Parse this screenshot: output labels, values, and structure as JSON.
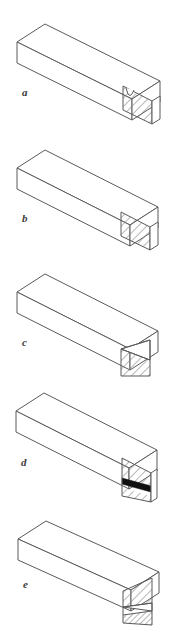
{
  "figure": {
    "background_color": "#ffffff",
    "line_color": "#5a5a5a",
    "hatch_color": "#7a7a7a",
    "solid_fill_color": "#111111",
    "face_fill_color": "#ffffff",
    "label_color": "#3a3a3a",
    "width": 174,
    "height": 629,
    "panels": [
      {
        "id": "a",
        "label": "a",
        "label_x": 22,
        "label_y": 96,
        "top_offset": 0,
        "end_pattern": "hatched-with-round-groove",
        "end_description": "End face fully cross-hatched with a small U-shaped groove notch at the top edge"
      },
      {
        "id": "b",
        "label": "b",
        "label_x": 22,
        "label_y": 96,
        "top_offset": 126,
        "end_pattern": "hatched-plain",
        "end_description": "End face fully cross-hatched, no inclusions"
      },
      {
        "id": "c",
        "label": "c",
        "label_x": 22,
        "label_y": 96,
        "top_offset": 252,
        "end_pattern": "hatched-with-diagonal-band",
        "end_description": "End face with a clear triangular wedge across the upper portion and cross-hatching below the diagonal"
      },
      {
        "id": "d",
        "label": "d",
        "label_x": 22,
        "label_y": 96,
        "top_offset": 378,
        "end_pattern": "hatched-with-solid-black-band",
        "end_description": "End face cross-hatched with a solid black horizontal band across the lower third"
      },
      {
        "id": "e",
        "label": "e",
        "label_x": 22,
        "label_y": 96,
        "top_offset": 503,
        "end_pattern": "hatched-layered-bands",
        "end_description": "End face divided into layered horizontal bands: hatched block, clear triangular wedge, and a dense hatched strip at the bottom"
      }
    ]
  }
}
